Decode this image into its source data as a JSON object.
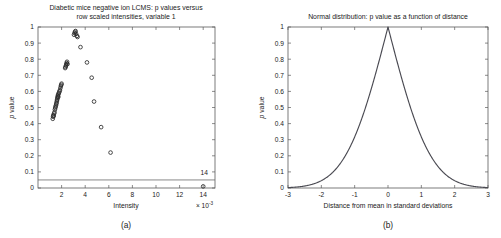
{
  "figure": {
    "captions": [
      {
        "id": "a",
        "text": "(a)"
      },
      {
        "id": "b",
        "text": "(b)"
      }
    ]
  },
  "chart_data": [
    {
      "type": "scatter",
      "panel": "a",
      "title_line1": "Diabetic mice negative ion LCMS: p values versus",
      "title_line2": "row scaled intensities, variable 1",
      "title_italic_token": "p",
      "xlabel": "Intensity",
      "ylabel": "p value",
      "x_multiplier": "× 10",
      "x_multiplier_exponent": "-3",
      "xlim": [
        0,
        15
      ],
      "ylim": [
        0,
        1
      ],
      "xticks": [
        2,
        4,
        6,
        8,
        10,
        12,
        14
      ],
      "yticks": [
        0,
        0.1,
        0.2,
        0.3,
        0.4,
        0.5,
        0.6,
        0.7,
        0.8,
        0.9,
        1
      ],
      "grid": false,
      "marker": "open-circle",
      "threshold_line": {
        "y": 0.05,
        "label": "significance threshold"
      },
      "annotations": [
        {
          "text": "14",
          "x": 14.0,
          "y": 0.075
        }
      ],
      "points": [
        {
          "x": 1.25,
          "y": 0.43
        },
        {
          "x": 1.28,
          "y": 0.443
        },
        {
          "x": 1.3,
          "y": 0.452
        },
        {
          "x": 1.33,
          "y": 0.447
        },
        {
          "x": 1.36,
          "y": 0.462
        },
        {
          "x": 1.4,
          "y": 0.47
        },
        {
          "x": 1.43,
          "y": 0.487
        },
        {
          "x": 1.46,
          "y": 0.497
        },
        {
          "x": 1.49,
          "y": 0.505
        },
        {
          "x": 1.52,
          "y": 0.513
        },
        {
          "x": 1.55,
          "y": 0.522
        },
        {
          "x": 1.57,
          "y": 0.53
        },
        {
          "x": 1.6,
          "y": 0.54
        },
        {
          "x": 1.62,
          "y": 0.548
        },
        {
          "x": 1.64,
          "y": 0.556
        },
        {
          "x": 1.66,
          "y": 0.563
        },
        {
          "x": 1.68,
          "y": 0.571
        },
        {
          "x": 1.7,
          "y": 0.578
        },
        {
          "x": 1.72,
          "y": 0.566
        },
        {
          "x": 1.74,
          "y": 0.585
        },
        {
          "x": 1.78,
          "y": 0.592
        },
        {
          "x": 1.82,
          "y": 0.6
        },
        {
          "x": 1.86,
          "y": 0.608
        },
        {
          "x": 1.9,
          "y": 0.622
        },
        {
          "x": 1.94,
          "y": 0.634
        },
        {
          "x": 1.97,
          "y": 0.641
        },
        {
          "x": 2.0,
          "y": 0.648
        },
        {
          "x": 2.3,
          "y": 0.745
        },
        {
          "x": 2.34,
          "y": 0.752
        },
        {
          "x": 2.37,
          "y": 0.76
        },
        {
          "x": 2.4,
          "y": 0.768
        },
        {
          "x": 2.43,
          "y": 0.776
        },
        {
          "x": 2.46,
          "y": 0.784
        },
        {
          "x": 2.5,
          "y": 0.77
        },
        {
          "x": 3.05,
          "y": 0.952
        },
        {
          "x": 3.1,
          "y": 0.962
        },
        {
          "x": 3.14,
          "y": 0.97
        },
        {
          "x": 3.18,
          "y": 0.975
        },
        {
          "x": 3.22,
          "y": 0.958
        },
        {
          "x": 3.3,
          "y": 0.945
        },
        {
          "x": 3.35,
          "y": 0.938
        },
        {
          "x": 3.6,
          "y": 0.875
        },
        {
          "x": 4.15,
          "y": 0.78
        },
        {
          "x": 4.55,
          "y": 0.685
        },
        {
          "x": 4.75,
          "y": 0.537
        },
        {
          "x": 5.35,
          "y": 0.378
        },
        {
          "x": 6.15,
          "y": 0.22
        },
        {
          "x": 14.0,
          "y": 0.01
        }
      ]
    },
    {
      "type": "line",
      "panel": "b",
      "title": "Normal distribution: p value as a function of distance",
      "title_italic_token": "p",
      "xlabel": "Distance from mean in standard deviations",
      "ylabel": "p value",
      "xlim": [
        -3,
        3
      ],
      "ylim": [
        0,
        1
      ],
      "xticks": [
        -3,
        -2,
        -1,
        0,
        1,
        2,
        3
      ],
      "yticks": [
        0,
        0.1,
        0.2,
        0.3,
        0.4,
        0.5,
        0.6,
        0.7,
        0.8,
        0.9,
        1
      ],
      "grid": false,
      "formula": "p = 2(1 - Phi(|z|))",
      "series": [
        {
          "name": "two-tailed p value",
          "color": "#4a4a52",
          "x": [
            -3.0,
            -2.9,
            -2.8,
            -2.7,
            -2.6,
            -2.5,
            -2.4,
            -2.3,
            -2.2,
            -2.1,
            -2.0,
            -1.9,
            -1.8,
            -1.7,
            -1.6,
            -1.5,
            -1.4,
            -1.3,
            -1.2,
            -1.1,
            -1.0,
            -0.9,
            -0.8,
            -0.7,
            -0.6,
            -0.5,
            -0.4,
            -0.3,
            -0.2,
            -0.1,
            0.0,
            0.1,
            0.2,
            0.3,
            0.4,
            0.5,
            0.6,
            0.7,
            0.8,
            0.9,
            1.0,
            1.1,
            1.2,
            1.3,
            1.4,
            1.5,
            1.6,
            1.7,
            1.8,
            1.9,
            2.0,
            2.1,
            2.2,
            2.3,
            2.4,
            2.5,
            2.6,
            2.7,
            2.8,
            2.9,
            3.0
          ],
          "values": [
            0.0027,
            0.0037,
            0.0051,
            0.0069,
            0.0093,
            0.0124,
            0.0164,
            0.0214,
            0.0278,
            0.0357,
            0.0455,
            0.0574,
            0.0719,
            0.0891,
            0.1096,
            0.1336,
            0.1615,
            0.1936,
            0.2301,
            0.2713,
            0.3173,
            0.3681,
            0.4237,
            0.4839,
            0.5485,
            0.6171,
            0.6892,
            0.7642,
            0.8415,
            0.9203,
            1.0,
            0.9203,
            0.8415,
            0.7642,
            0.6892,
            0.6171,
            0.5485,
            0.4839,
            0.4237,
            0.3681,
            0.3173,
            0.2713,
            0.2301,
            0.1936,
            0.1615,
            0.1336,
            0.1096,
            0.0891,
            0.0719,
            0.0574,
            0.0455,
            0.0357,
            0.0278,
            0.0214,
            0.0164,
            0.0124,
            0.0093,
            0.0069,
            0.0051,
            0.0037,
            0.0027
          ]
        }
      ]
    }
  ]
}
